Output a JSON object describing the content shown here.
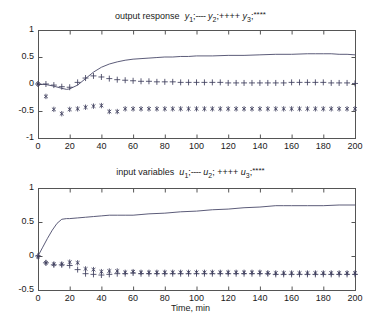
{
  "figure": {
    "width": 381,
    "height": 332,
    "background": "#ffffff",
    "axis_color": "#555555",
    "line_color": "#4a4a6a",
    "marker_color": "#3d3d5c"
  },
  "panels": [
    {
      "name": "output-response",
      "title_prefix": "output response",
      "legend": [
        {
          "var": "y",
          "sub": "1",
          "sep": ";",
          "marker": "----"
        },
        {
          "var": "y",
          "sub": "2",
          "sep": ";",
          "marker": "++++"
        },
        {
          "var": "y",
          "sub": "3",
          "sep": ";",
          "marker": "****"
        }
      ],
      "xlabel": "",
      "ylabel": "",
      "ytick_labels": [
        "1",
        "0.5",
        "0",
        "-0.5",
        "-1"
      ],
      "xtick_labels": [
        "0",
        "20",
        "40",
        "60",
        "80",
        "100",
        "120",
        "140",
        "160",
        "180",
        "200"
      ]
    },
    {
      "name": "input-variables",
      "title_prefix": "input variables",
      "legend": [
        {
          "var": "u",
          "sub": "1",
          "sep": ";",
          "marker": "----"
        },
        {
          "var": "u",
          "sub": "2",
          "sep": ";",
          "marker": "++++"
        },
        {
          "var": "u",
          "sub": "3",
          "sep": ";",
          "marker": "****"
        }
      ],
      "xlabel": "Time, min",
      "ylabel": "",
      "ytick_labels": [
        "1",
        "0.5",
        "0",
        "-0.5"
      ],
      "xtick_labels": [
        "0",
        "20",
        "40",
        "60",
        "80",
        "100",
        "120",
        "140",
        "160",
        "180",
        "200"
      ]
    }
  ],
  "chart_data": [
    {
      "type": "line",
      "title": "output response  y1;---- y2;++++ y3; ****",
      "xlabel": "",
      "ylabel": "",
      "xlim": [
        0,
        200
      ],
      "ylim": [
        -1,
        1
      ],
      "xticks": [
        0,
        20,
        40,
        60,
        80,
        100,
        120,
        140,
        160,
        180,
        200
      ],
      "yticks": [
        -1,
        -0.5,
        0,
        0.5,
        1
      ],
      "grid": false,
      "legend_position": "title",
      "series": [
        {
          "name": "y1",
          "style": "solid-line",
          "marker": "none",
          "x": [
            0,
            5,
            10,
            15,
            18,
            20,
            25,
            30,
            35,
            40,
            45,
            50,
            55,
            60,
            65,
            70,
            75,
            80,
            85,
            90,
            95,
            100,
            110,
            120,
            130,
            140,
            150,
            160,
            170,
            175,
            180,
            185,
            190,
            195,
            200
          ],
          "values": [
            0.0,
            -0.01,
            -0.04,
            -0.08,
            -0.1,
            -0.09,
            -0.02,
            0.1,
            0.22,
            0.31,
            0.37,
            0.41,
            0.44,
            0.46,
            0.47,
            0.48,
            0.49,
            0.5,
            0.5,
            0.51,
            0.51,
            0.52,
            0.52,
            0.53,
            0.53,
            0.54,
            0.55,
            0.55,
            0.56,
            0.56,
            0.56,
            0.56,
            0.55,
            0.55,
            0.54
          ]
        },
        {
          "name": "y2",
          "style": "markers",
          "marker": "+",
          "x": [
            0,
            5,
            10,
            15,
            20,
            25,
            30,
            35,
            40,
            45,
            50,
            55,
            60,
            65,
            70,
            75,
            80,
            85,
            90,
            95,
            100,
            105,
            110,
            115,
            120,
            125,
            130,
            135,
            140,
            145,
            150,
            155,
            160,
            165,
            170,
            175,
            180,
            185,
            190,
            195,
            200
          ],
          "values": [
            0.0,
            0.0,
            -0.02,
            -0.05,
            -0.06,
            0.03,
            0.11,
            0.15,
            0.13,
            0.1,
            0.08,
            0.07,
            0.06,
            0.05,
            0.05,
            0.04,
            0.04,
            0.04,
            0.03,
            0.03,
            0.03,
            0.03,
            0.03,
            0.03,
            0.02,
            0.02,
            0.02,
            0.02,
            0.02,
            0.02,
            0.02,
            0.02,
            0.03,
            0.03,
            0.03,
            0.03,
            0.03,
            0.02,
            0.02,
            0.02,
            0.01
          ]
        },
        {
          "name": "y3",
          "style": "markers",
          "marker": "*",
          "x": [
            0,
            5,
            10,
            15,
            20,
            25,
            30,
            35,
            40,
            45,
            50,
            55,
            60,
            65,
            70,
            75,
            80,
            85,
            90,
            95,
            100,
            105,
            110,
            115,
            120,
            125,
            130,
            135,
            140,
            145,
            150,
            155,
            160,
            165,
            170,
            175,
            180,
            185,
            190,
            195,
            200
          ],
          "values": [
            0.0,
            -0.23,
            -0.47,
            -0.55,
            -0.47,
            -0.46,
            -0.43,
            -0.41,
            -0.4,
            -0.51,
            -0.51,
            -0.46,
            -0.46,
            -0.46,
            -0.46,
            -0.46,
            -0.46,
            -0.46,
            -0.46,
            -0.46,
            -0.46,
            -0.46,
            -0.46,
            -0.46,
            -0.46,
            -0.46,
            -0.46,
            -0.46,
            -0.46,
            -0.46,
            -0.46,
            -0.46,
            -0.46,
            -0.46,
            -0.46,
            -0.46,
            -0.46,
            -0.46,
            -0.46,
            -0.46,
            -0.46
          ]
        }
      ]
    },
    {
      "type": "line",
      "title": "input variables  u1;---- u2; ++++ u3; ****",
      "xlabel": "Time, min",
      "ylabel": "",
      "xlim": [
        0,
        200
      ],
      "ylim": [
        -0.5,
        1
      ],
      "xticks": [
        0,
        20,
        40,
        60,
        80,
        100,
        120,
        140,
        160,
        180,
        200
      ],
      "yticks": [
        -0.5,
        0,
        0.5,
        1
      ],
      "grid": false,
      "legend_position": "title",
      "series": [
        {
          "name": "u1",
          "style": "solid-line",
          "marker": "none",
          "x": [
            0,
            3,
            6,
            9,
            12,
            15,
            18,
            20,
            25,
            30,
            35,
            40,
            45,
            50,
            55,
            60,
            65,
            70,
            80,
            90,
            100,
            110,
            120,
            130,
            140,
            150,
            155,
            160,
            170,
            180,
            190,
            200
          ],
          "values": [
            0.0,
            0.13,
            0.26,
            0.38,
            0.48,
            0.54,
            0.55,
            0.55,
            0.56,
            0.57,
            0.58,
            0.59,
            0.6,
            0.6,
            0.6,
            0.6,
            0.61,
            0.62,
            0.63,
            0.65,
            0.66,
            0.68,
            0.69,
            0.71,
            0.72,
            0.74,
            0.74,
            0.74,
            0.74,
            0.74,
            0.75,
            0.75
          ]
        },
        {
          "name": "u2",
          "style": "markers",
          "marker": "+",
          "x": [
            0,
            5,
            10,
            15,
            20,
            25,
            30,
            35,
            40,
            45,
            50,
            55,
            60,
            65,
            70,
            75,
            80,
            85,
            90,
            95,
            100,
            105,
            110,
            115,
            120,
            125,
            130,
            135,
            140,
            145,
            150,
            155,
            160,
            165,
            170,
            175,
            180,
            185,
            190,
            195,
            200
          ],
          "values": [
            0.0,
            -0.1,
            -0.13,
            -0.13,
            -0.14,
            -0.2,
            -0.26,
            -0.27,
            -0.28,
            -0.27,
            -0.26,
            -0.26,
            -0.25,
            -0.26,
            -0.26,
            -0.26,
            -0.26,
            -0.26,
            -0.26,
            -0.26,
            -0.26,
            -0.26,
            -0.26,
            -0.26,
            -0.26,
            -0.26,
            -0.26,
            -0.26,
            -0.26,
            -0.26,
            -0.27,
            -0.27,
            -0.27,
            -0.27,
            -0.27,
            -0.27,
            -0.27,
            -0.27,
            -0.27,
            -0.27,
            -0.27
          ]
        },
        {
          "name": "u3",
          "style": "markers",
          "marker": "*",
          "x": [
            0,
            5,
            10,
            15,
            20,
            25,
            30,
            35,
            40,
            45,
            50,
            55,
            60,
            65,
            70,
            75,
            80,
            85,
            90,
            95,
            100,
            105,
            110,
            115,
            120,
            125,
            130,
            135,
            140,
            145,
            150,
            155,
            160,
            165,
            170,
            175,
            180,
            185,
            190,
            195,
            200
          ],
          "values": [
            -0.01,
            -0.1,
            -0.12,
            -0.12,
            -0.09,
            -0.1,
            -0.19,
            -0.2,
            -0.23,
            -0.22,
            -0.22,
            -0.24,
            -0.23,
            -0.24,
            -0.24,
            -0.24,
            -0.24,
            -0.24,
            -0.24,
            -0.24,
            -0.24,
            -0.24,
            -0.24,
            -0.24,
            -0.24,
            -0.24,
            -0.24,
            -0.24,
            -0.24,
            -0.25,
            -0.25,
            -0.25,
            -0.25,
            -0.25,
            -0.25,
            -0.25,
            -0.25,
            -0.25,
            -0.25,
            -0.25,
            -0.25
          ]
        }
      ]
    }
  ]
}
